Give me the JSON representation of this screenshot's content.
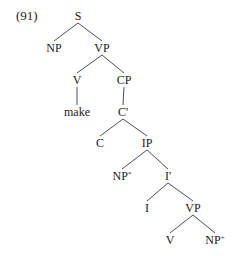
{
  "example_number": "(91)",
  "tree": {
    "nodes": [
      {
        "id": "S",
        "label": "S",
        "sup": "",
        "x": 78,
        "y": 16
      },
      {
        "id": "NP1",
        "label": "NP",
        "sup": "",
        "x": 54,
        "y": 48
      },
      {
        "id": "VP1",
        "label": "VP",
        "sup": "",
        "x": 102,
        "y": 48
      },
      {
        "id": "V1",
        "label": "V",
        "sup": "",
        "x": 77,
        "y": 80
      },
      {
        "id": "CP",
        "label": "CP",
        "sup": "",
        "x": 124,
        "y": 80
      },
      {
        "id": "make",
        "label": "make",
        "sup": "",
        "x": 77,
        "y": 112
      },
      {
        "id": "Cbar",
        "label": "C'",
        "sup": "",
        "x": 123,
        "y": 112
      },
      {
        "id": "C",
        "label": "C",
        "sup": "",
        "x": 100,
        "y": 143
      },
      {
        "id": "IP",
        "label": "IP",
        "sup": "",
        "x": 147,
        "y": 143
      },
      {
        "id": "NP2",
        "label": "NP",
        "sup": "*",
        "x": 122,
        "y": 176
      },
      {
        "id": "Ibar",
        "label": "I'",
        "sup": "",
        "x": 168,
        "y": 176
      },
      {
        "id": "I",
        "label": "I",
        "sup": "",
        "x": 147,
        "y": 208
      },
      {
        "id": "VP2",
        "label": "VP",
        "sup": "",
        "x": 193,
        "y": 208
      },
      {
        "id": "V2",
        "label": "V",
        "sup": "",
        "x": 170,
        "y": 240
      },
      {
        "id": "NP3",
        "label": "NP",
        "sup": "+",
        "x": 215,
        "y": 240
      }
    ],
    "edges": [
      [
        "S",
        "NP1"
      ],
      [
        "S",
        "VP1"
      ],
      [
        "VP1",
        "V1"
      ],
      [
        "VP1",
        "CP"
      ],
      [
        "V1",
        "make"
      ],
      [
        "CP",
        "Cbar"
      ],
      [
        "Cbar",
        "C"
      ],
      [
        "Cbar",
        "IP"
      ],
      [
        "IP",
        "NP2"
      ],
      [
        "IP",
        "Ibar"
      ],
      [
        "Ibar",
        "I"
      ],
      [
        "Ibar",
        "VP2"
      ],
      [
        "VP2",
        "V2"
      ],
      [
        "VP2",
        "NP3"
      ]
    ]
  }
}
